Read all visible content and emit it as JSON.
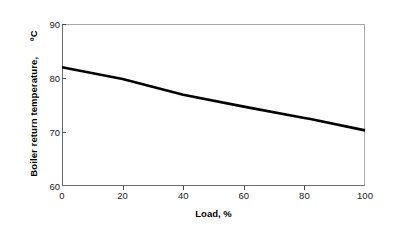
{
  "chart_data": {
    "type": "line",
    "title": "",
    "xlabel": "Load, %",
    "ylabel": "Boiler return temperature,",
    "yunit": "ºC",
    "xlim": [
      0,
      100
    ],
    "ylim": [
      60,
      90
    ],
    "xticks": [
      0,
      20,
      40,
      60,
      80,
      100
    ],
    "yticks": [
      60,
      70,
      80,
      90
    ],
    "grid": false,
    "legend": null,
    "series": [
      {
        "name": "Boiler return temperature",
        "x": [
          0,
          20,
          40,
          60,
          80,
          82,
          100
        ],
        "values": [
          82.0,
          79.8,
          76.9,
          74.7,
          72.6,
          72.4,
          70.3
        ],
        "color": "#000000",
        "line_width": 2.6
      }
    ]
  },
  "axes": {
    "x_title": "Load, %",
    "y_title": "Boiler return temperature,",
    "y_unit": "ºC",
    "x_tick_labels": [
      "0",
      "20",
      "40",
      "60",
      "80",
      "100"
    ],
    "y_tick_labels": [
      "60",
      "70",
      "80",
      "90"
    ],
    "frame_color": "#a8a8a8",
    "axis_color": "#6d6d6d",
    "tick_color": "#4a4a4a",
    "background": "#ffffff"
  }
}
